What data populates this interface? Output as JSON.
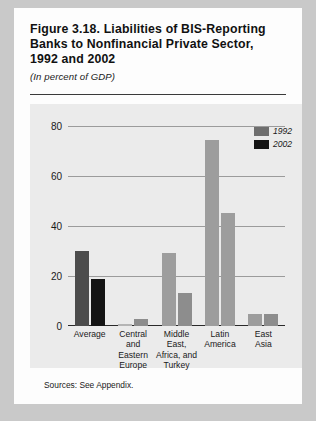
{
  "figure": {
    "title": "Figure 3.18. Liabilities of BIS-Reporting Banks to Nonfinancial Private Sector, 1992 and 2002",
    "subtitle": "(In percent of GDP)",
    "sources": "Sources: See Appendix."
  },
  "legend": {
    "items": [
      {
        "label": "1992",
        "color": "#6e6e6e"
      },
      {
        "label": "2002",
        "color": "#141414"
      }
    ]
  },
  "axis": {
    "yticks": [
      "0",
      "20",
      "40",
      "60",
      "80"
    ]
  },
  "chart_data": {
    "type": "bar",
    "title": "Figure 3.18. Liabilities of BIS-Reporting Banks to Nonfinancial Private Sector, 1992 and 2002",
    "subtitle": "(In percent of GDP)",
    "xlabel": "",
    "ylabel": "",
    "ylim": [
      0,
      85
    ],
    "yticks": [
      0,
      20,
      40,
      60,
      80
    ],
    "grid": true,
    "legend_position": "top-right",
    "categories": [
      "Average",
      "Central and Eastern Europe",
      "Middle East, Africa, and Turkey",
      "Latin America",
      "East Asia"
    ],
    "category_lines": [
      [
        "Average"
      ],
      [
        "Central",
        "and",
        "Eastern",
        "Europe"
      ],
      [
        "Middle",
        "East,",
        "Africa, and",
        "Turkey"
      ],
      [
        "Latin",
        "America"
      ],
      [
        "East",
        "Asia"
      ]
    ],
    "series": [
      {
        "name": "1992",
        "values": [
          32,
          1,
          31,
          79,
          5
        ]
      },
      {
        "name": "2002",
        "values": [
          20,
          3,
          14,
          48,
          5
        ]
      }
    ]
  }
}
